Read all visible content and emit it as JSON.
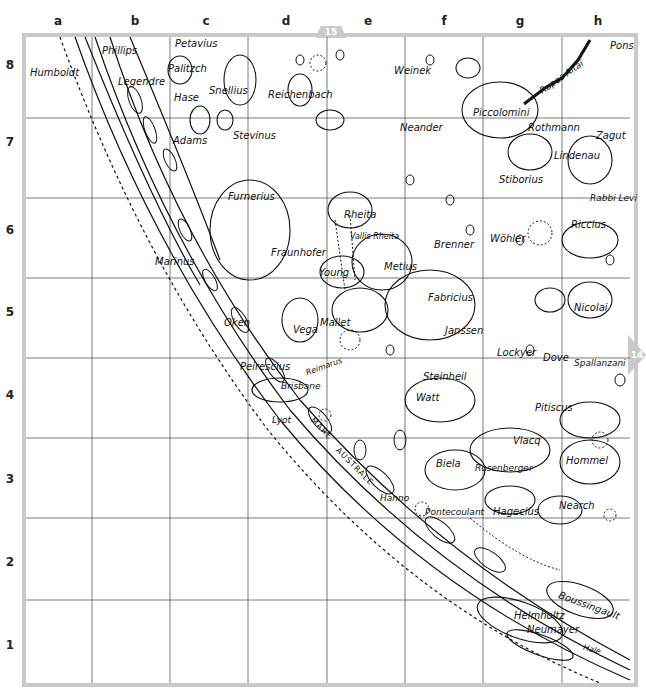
{
  "map": {
    "title": "Lunar chart section — south-east limb (Mare Australe region)",
    "columns": [
      "a",
      "b",
      "c",
      "d",
      "e",
      "f",
      "g",
      "h"
    ],
    "rows": [
      "8",
      "7",
      "6",
      "5",
      "4",
      "3",
      "2",
      "1"
    ],
    "adjacent_sheets": {
      "top": "15",
      "right": "14"
    },
    "frame_color": "#c9c9c9",
    "line_color": "#111111"
  },
  "features": {
    "humboldt": "Humboldt",
    "phillips": "Phillips",
    "petavius": "Petavius",
    "palitzsch": "Palitzch",
    "legendre": "Legendre",
    "hase": "Hase",
    "snellius": "Snellius",
    "reichenbach": "Reichenbach",
    "weinek": "Weinek",
    "piccolomini": "Piccolomini",
    "rupes_altai": "Rupes Altai",
    "pons": "Pons",
    "adams": "Adams",
    "stevinus": "Stevinus",
    "neander": "Neander",
    "rothmann": "Rothmann",
    "zagut": "Zagut",
    "lindenau": "Lindenau",
    "stiborius": "Stiborius",
    "rabbi_levi": "Rabbi Levi",
    "furnerius": "Furnerius",
    "rheita": "Rheita",
    "vallis_rheita": "Vallis Rheita",
    "brenner": "Brenner",
    "wohler": "Wöhler",
    "riccius": "Riccius",
    "marinus": "Marinus",
    "fraunhofer": "Fraunhofer",
    "young": "Young",
    "metius": "Metius",
    "fabricius": "Fabricius",
    "nicolai": "Nicolai",
    "oken": "Oken",
    "vega": "Vega",
    "mallet": "Mallet",
    "janssen": "Janssen",
    "lockyer": "Lockyer",
    "dove": "Dove",
    "spallanzani": "Spallanzani",
    "peirescius": "Peirescius",
    "reimarus": "Reimarus",
    "brisbane": "Brisbane",
    "steinheil": "Steinheil",
    "watt": "Watt",
    "pitiscus": "Pitiscus",
    "lyot": "Lyot",
    "mare": "MARE",
    "australe": "AUSTRALE",
    "vlacq": "Vlacq",
    "hommel": "Hommel",
    "biela": "Biela",
    "rosenberger": "Rosenberger",
    "hanno": "Hanno",
    "pontecoulant": "Pontecoulant",
    "hagecius": "Hagecius",
    "nearch": "Nearch",
    "helmholtz": "Helmholtz",
    "boussingault": "Boussingault",
    "neumayer": "Neumayer",
    "hale": "Hale"
  }
}
